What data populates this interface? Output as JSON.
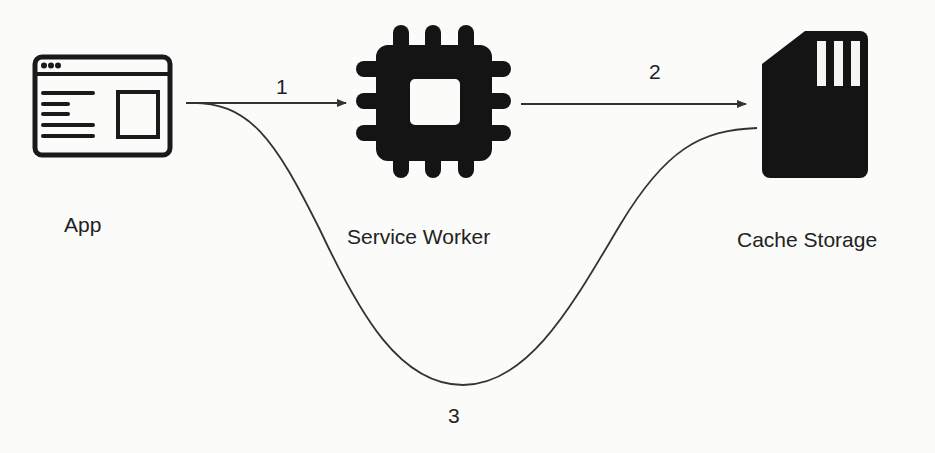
{
  "diagram": {
    "type": "flow",
    "nodes": [
      {
        "id": "app",
        "label": "App",
        "icon": "browser-window-icon"
      },
      {
        "id": "service_worker",
        "label": "Service Worker",
        "icon": "cpu-chip-icon"
      },
      {
        "id": "cache_storage",
        "label": "Cache Storage",
        "icon": "sd-card-icon"
      }
    ],
    "edges": [
      {
        "from": "app",
        "to": "service_worker",
        "label": "1",
        "style": "straight-arrow"
      },
      {
        "from": "service_worker",
        "to": "cache_storage",
        "label": "2",
        "style": "straight-arrow"
      },
      {
        "from": "app",
        "to": "cache_storage",
        "label": "3",
        "style": "curved-line"
      }
    ],
    "colors": {
      "background": "#fbfbfa",
      "ink": "#1a1a1a",
      "line": "#333333"
    }
  },
  "labels": {
    "app": "App",
    "service_worker": "Service Worker",
    "cache_storage": "Cache Storage",
    "step_1": "1",
    "step_2": "2",
    "step_3": "3"
  }
}
